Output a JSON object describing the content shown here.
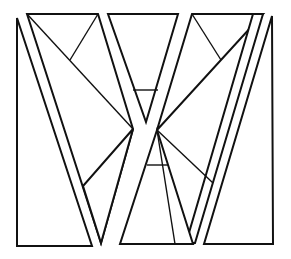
{
  "figure": {
    "width": 291,
    "height": 259,
    "stroke_color": "#111111",
    "background": "#ffffff",
    "shapes": [
      {
        "name": "left-tall-triangle",
        "points": [
          [
            17,
            18
          ],
          [
            17,
            246
          ],
          [
            92,
            246
          ]
        ]
      },
      {
        "name": "upper-left-triangle",
        "points": [
          [
            27,
            14
          ],
          [
            98,
            14
          ],
          [
            133,
            126
          ]
        ]
      },
      {
        "name": "left-diagonal-strip-triangle",
        "points": [
          [
            27,
            14
          ],
          [
            133,
            126
          ],
          [
            100,
            244
          ]
        ]
      },
      {
        "name": "upper-center-triangle",
        "points": [
          [
            108,
            14
          ],
          [
            178,
            14
          ],
          [
            145,
            126
          ]
        ]
      },
      {
        "name": "upper-right-triangle",
        "points": [
          [
            192,
            14
          ],
          [
            263,
            14
          ],
          [
            157,
            126
          ]
        ]
      },
      {
        "name": "right-diagonal-strip",
        "points": [
          [
            263,
            14
          ],
          [
            157,
            126
          ],
          [
            195,
            190
          ]
        ]
      },
      {
        "name": "right-tall-quad",
        "points": [
          [
            272,
            16
          ],
          [
            274,
            244
          ],
          [
            204,
            244
          ]
        ]
      },
      {
        "name": "lower-center-triangle",
        "points": [
          [
            159,
            130
          ],
          [
            122,
            244
          ],
          [
            195,
            244
          ]
        ]
      }
    ],
    "inner_lines": [
      {
        "name": "upper-left-inner",
        "from": [
          98,
          14
        ],
        "to": [
          70,
          60
        ]
      },
      {
        "name": "upper-center-crossbar",
        "from": [
          133,
          90
        ],
        "to": [
          159,
          90
        ]
      },
      {
        "name": "upper-right-inner",
        "from": [
          192,
          14
        ],
        "to": [
          221,
          60
        ]
      },
      {
        "name": "lower-left-inner",
        "from": [
          133,
          129
        ],
        "to": [
          83,
          186
        ]
      },
      {
        "name": "lower-center-crossbar",
        "from": [
          145,
          166
        ],
        "to": [
          167,
          166
        ]
      },
      {
        "name": "lower-right-inner",
        "from": [
          157,
          130
        ],
        "to": [
          213,
          183
        ]
      },
      {
        "name": "lower-center-left-spoke",
        "from": [
          157,
          130
        ],
        "to": [
          193,
          244
        ]
      }
    ]
  }
}
